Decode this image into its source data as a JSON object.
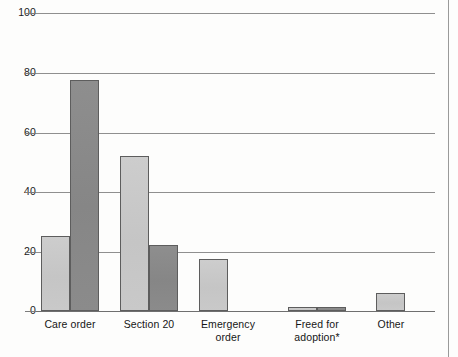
{
  "chart_data": {
    "type": "bar",
    "title": "",
    "xlabel": "",
    "ylabel": "",
    "ylim": [
      0,
      100
    ],
    "yticks": [
      0,
      20,
      40,
      60,
      80,
      100
    ],
    "grid": true,
    "legend": "none",
    "categories": [
      "Care order",
      "Section 20",
      "Emergency order",
      "Freed for adoption*",
      "Other"
    ],
    "category_lines": [
      [
        "Care order"
      ],
      [
        "Section 20"
      ],
      [
        "Emergency",
        "order"
      ],
      [
        "Freed for",
        "adoption*"
      ],
      [
        "Other"
      ]
    ],
    "series": [
      {
        "name": "series-1",
        "color": "#c9c9c9",
        "values": [
          25,
          52,
          17.5,
          1.5,
          6
        ]
      },
      {
        "name": "series-2",
        "color": "#8a8a8a",
        "values": [
          77.5,
          22,
          0,
          1.5,
          0
        ]
      }
    ]
  },
  "axis": {
    "tick_labels": [
      "0",
      "20",
      "40",
      "60",
      "80",
      "100"
    ]
  }
}
